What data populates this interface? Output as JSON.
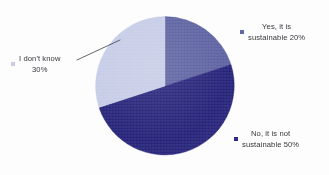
{
  "chart_data": {
    "type": "pie",
    "title": "",
    "subtitle": "",
    "xlabel": "",
    "ylabel": "",
    "legend_position": "around-pie",
    "grid": false,
    "start_angle_deg": 0,
    "direction": "clockwise",
    "categories": [
      "Yes, it is sustainable",
      "No, it is not sustainable",
      "I don't know"
    ],
    "values": [
      20,
      50,
      30
    ],
    "value_suffix": "%",
    "colors": [
      "#5b60a0",
      "#232078",
      "#c5cbe6"
    ],
    "slices": [
      {
        "label": "Yes, it is sustainable",
        "value": 20,
        "display": "20%",
        "color": "#5b60a0",
        "start_deg": 0,
        "end_deg": 72
      },
      {
        "label": "No, it is not sustainable",
        "value": 50,
        "display": "50%",
        "color": "#232078",
        "start_deg": 72,
        "end_deg": 252
      },
      {
        "label": "I don't know",
        "value": 30,
        "display": "30%",
        "color": "#c5cbe6",
        "start_deg": 252,
        "end_deg": 360
      }
    ]
  },
  "legends": {
    "yes": {
      "marker_name": "legend-swatch-yes",
      "color": "#5b60a0",
      "line1": "Yes, it is",
      "line2": "sustainable 20%"
    },
    "no": {
      "marker_name": "legend-swatch-no",
      "color": "#232078",
      "line1": "No, it is not",
      "line2": "sustainable 50%"
    },
    "dont_know": {
      "marker_name": "legend-swatch-dont-know",
      "color": "#c5cbe6",
      "line1": "I don't know",
      "line2": "30%"
    }
  },
  "annotations": {
    "leader_line": {
      "name": "leader-line-dont-know",
      "color": "#4a4a55",
      "from": "I don't know label",
      "to": "I don't know slice"
    }
  },
  "background_color": "#fdfdfe"
}
